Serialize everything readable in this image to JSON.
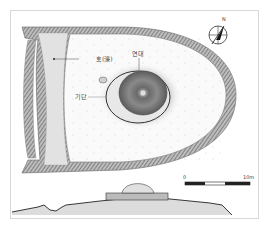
{
  "figure": {
    "type": "archaeological-site-plan",
    "labels": {
      "moat": "호(濠)",
      "beacon": "연대",
      "base": "기단"
    },
    "compass": {
      "direction_label": "N"
    },
    "scale_bar": {
      "start_label": "0",
      "end_label": "10m"
    }
  },
  "colors": {
    "hatch": "#6e6e6e",
    "hatch_dark": "#4a4a4a",
    "moat_fill": "#e4e4e4",
    "ground": "#f7f7f7",
    "line": "#333333"
  }
}
